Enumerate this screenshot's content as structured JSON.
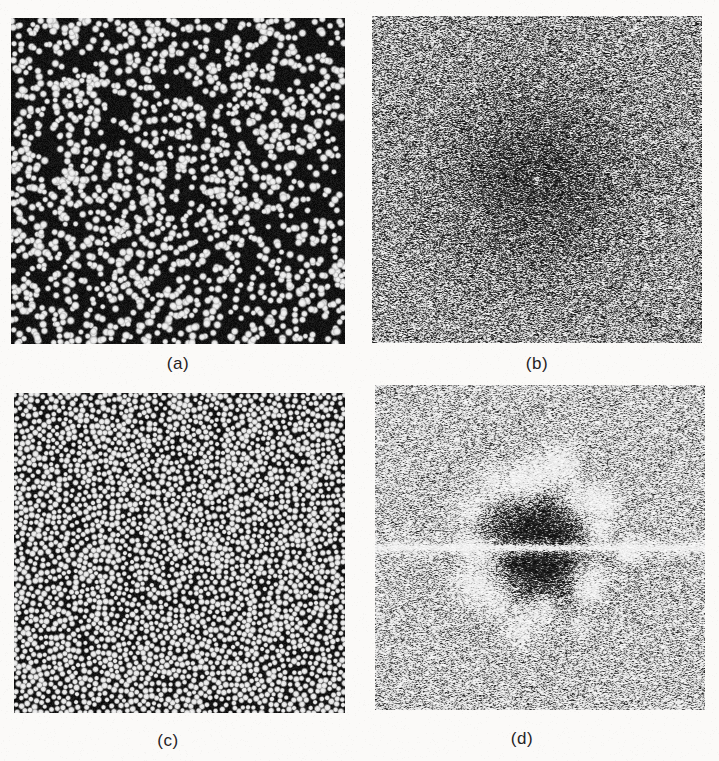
{
  "figure": {
    "background_color": "#fbfaf8",
    "panel_background_color": "#0a0a0a",
    "dot_color": "#f2f2f2",
    "caption_color": "#25221f",
    "width": 719,
    "height": 761
  },
  "panels": [
    {
      "id": "a",
      "caption": "(a)",
      "kind": "point-pattern",
      "description": "random (white noise) point distribution",
      "x": 11,
      "y": 18,
      "w": 334,
      "h": 326,
      "caption_x": 178,
      "caption_y": 354,
      "point_count": 1700,
      "dot_radius": 2.1,
      "min_spacing": 0
    },
    {
      "id": "b",
      "caption": "(b)",
      "kind": "power-spectrum",
      "description": "Fourier power spectrum of the random point distribution in (a)",
      "x": 372,
      "y": 16,
      "w": 330,
      "h": 327,
      "caption_x": 537,
      "caption_y": 354,
      "noise_density": 0.47,
      "center_dip_radius": 70,
      "has_ring": false,
      "has_horizontal_streak": false
    },
    {
      "id": "c",
      "caption": "(c)",
      "kind": "point-pattern",
      "description": "blue-noise (Poisson-disk) point distribution with local hexagonal order",
      "x": 14,
      "y": 393,
      "w": 331,
      "h": 320,
      "caption_x": 168,
      "caption_y": 731,
      "point_count": 3400,
      "dot_radius": 1.8,
      "min_spacing": 5.0
    },
    {
      "id": "d",
      "caption": "(d)",
      "kind": "power-spectrum",
      "description": "Fourier power spectrum of the blue-noise point distribution in (c); dark low-frequency core, bright ring of peaks and a bright horizontal streak",
      "x": 375,
      "y": 385,
      "w": 330,
      "h": 325,
      "caption_x": 522,
      "caption_y": 729,
      "noise_density": 0.5,
      "center_dip_radius": 58,
      "has_ring": true,
      "ring_radius": 72,
      "ring_peak_count": 18,
      "has_horizontal_streak": true,
      "streak_y_fraction": 0.5
    }
  ]
}
